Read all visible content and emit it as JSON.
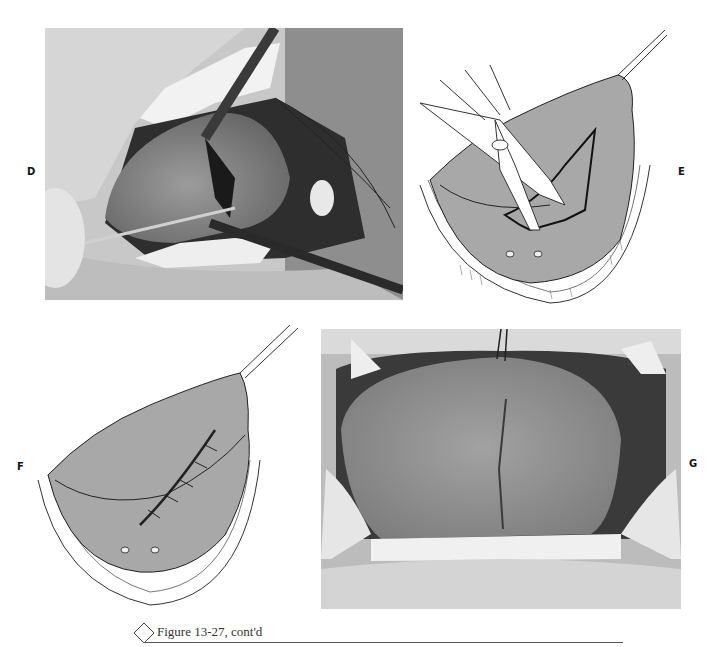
{
  "figure": {
    "caption": "Figure 13-27, cont'd",
    "caption_icon": "diamond-icon"
  },
  "panels": [
    {
      "label": "D",
      "type": "photograph",
      "description": "Intraoperative photo: tongue retracted with forceps and hemostat, incision with suture thread"
    },
    {
      "label": "E",
      "type": "illustration",
      "description": "Drawing: scissors excising wedge from tongue held by suture"
    },
    {
      "label": "F",
      "type": "illustration",
      "description": "Drawing: tongue with sutured closure along midline"
    },
    {
      "label": "G",
      "type": "photograph",
      "description": "Postoperative photo: healed tongue with midline suture line"
    }
  ],
  "colors": {
    "tongue_fill": "#a8a8a8",
    "line": "#222222",
    "background": "#ffffff"
  }
}
